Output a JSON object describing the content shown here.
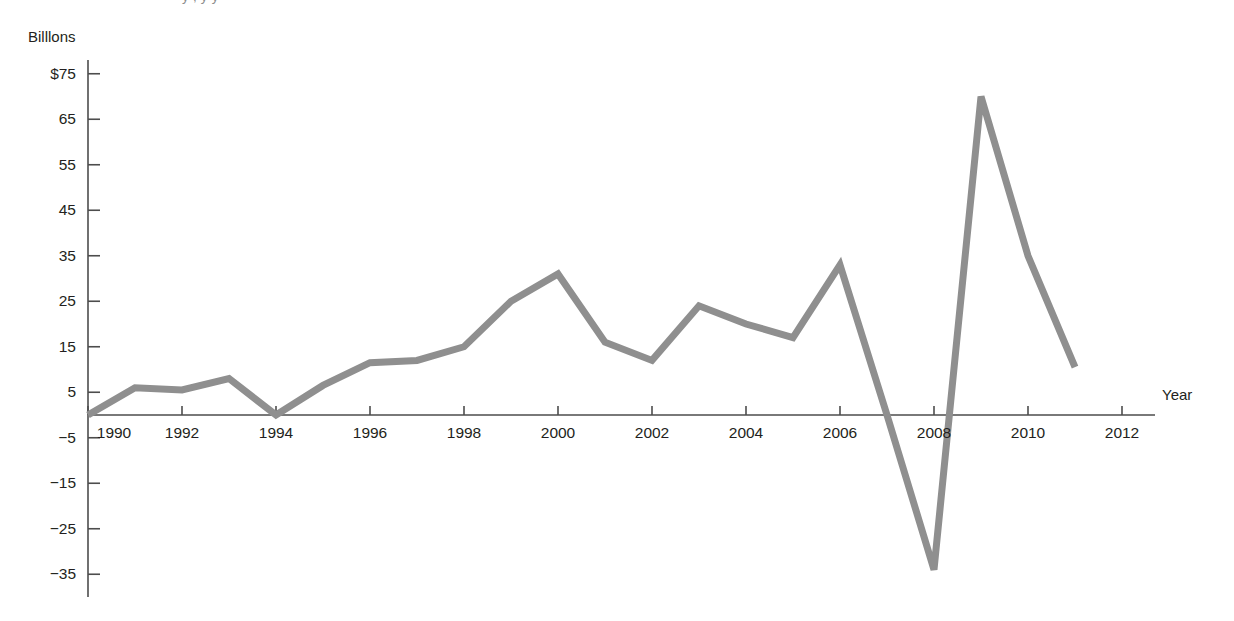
{
  "figure": {
    "clipped_top_caption": "y                        ,            y      y",
    "y_unit_label": "Billlons",
    "x_axis_title": "Year"
  },
  "chart_data": {
    "type": "line",
    "title": "",
    "subtitle": "",
    "xlabel": "Year",
    "ylabel": "Billlons",
    "x": [
      1990,
      1991,
      1992,
      1993,
      1994,
      1995,
      1996,
      1997,
      1998,
      1999,
      2000,
      2001,
      2002,
      2003,
      2004,
      2005,
      2006,
      2007,
      2008,
      2009,
      2010,
      2011
    ],
    "values": [
      0,
      6,
      5.5,
      8,
      0,
      6.5,
      11.5,
      12,
      15,
      25,
      31,
      16,
      12,
      24,
      20,
      17,
      33,
      0,
      -34,
      70,
      35,
      10.5
    ],
    "series": [
      {
        "name": "Value",
        "color": "#8f8f8f",
        "values": [
          0,
          6,
          5.5,
          8,
          0,
          6.5,
          11.5,
          12,
          15,
          25,
          31,
          16,
          12,
          24,
          20,
          17,
          33,
          0,
          -34,
          70,
          35,
          10.5
        ]
      }
    ],
    "xlim": [
      1990,
      2012.8
    ],
    "ylim": [
      -40,
      78
    ],
    "xticks": [
      1990,
      1992,
      1994,
      1996,
      1998,
      2000,
      2002,
      2004,
      2006,
      2008,
      2010,
      2012
    ],
    "xtick_labels": [
      "1990",
      "1992",
      "1994",
      "1996",
      "1998",
      "2000",
      "2002",
      "2004",
      "2006",
      "2008",
      "2010",
      "2012"
    ],
    "yticks": [
      75,
      65,
      55,
      45,
      35,
      25,
      15,
      5,
      -5,
      -15,
      -25,
      -35
    ],
    "ytick_labels": [
      "$75",
      "65",
      "55",
      "45",
      "35",
      "25",
      "15",
      "5",
      "−5",
      "−15",
      "−25",
      "−35"
    ],
    "grid": false,
    "legend": "none",
    "line_color": "#8f8f8f",
    "axis_color": "#4d4d4d"
  }
}
